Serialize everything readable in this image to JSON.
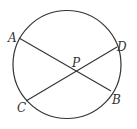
{
  "diagram": {
    "type": "geometry",
    "stroke_color": "#333333",
    "background": "#ffffff",
    "circle": {
      "cx": 67,
      "cy": 64.5,
      "r": 54
    },
    "points": {
      "A": {
        "label": "A",
        "x": 19,
        "y": 38,
        "label_x": 8,
        "label_y": 42
      },
      "B": {
        "label": "B",
        "x": 111,
        "y": 91,
        "label_x": 112,
        "label_y": 104
      },
      "C": {
        "label": "C",
        "x": 26,
        "y": 101,
        "label_x": 17,
        "label_y": 112
      },
      "D": {
        "label": "D",
        "x": 117,
        "y": 47,
        "label_x": 117,
        "label_y": 51
      },
      "P": {
        "label": "P",
        "x": 74,
        "y": 70,
        "label_x": 72,
        "label_y": 67
      }
    },
    "chords": [
      {
        "name": "AB",
        "from": "A",
        "to": "B"
      },
      {
        "name": "CD",
        "from": "C",
        "to": "D"
      }
    ]
  }
}
